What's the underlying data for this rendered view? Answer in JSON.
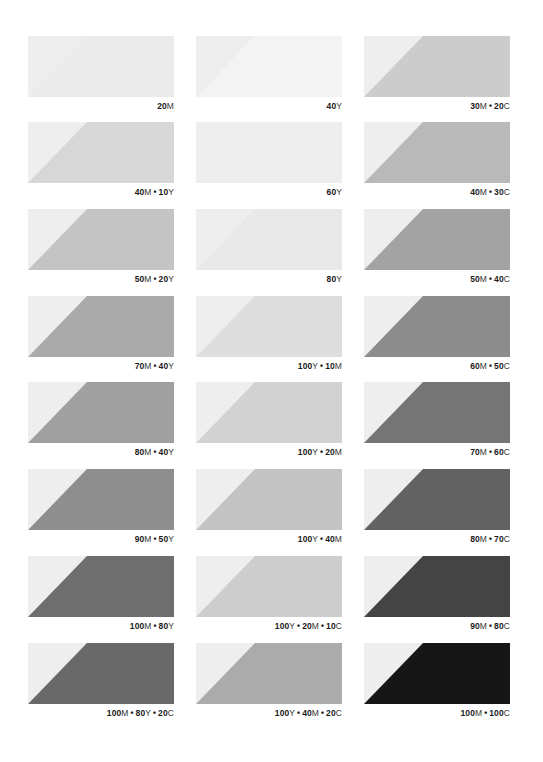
{
  "page": {
    "background": "#ffffff",
    "base_tint": "#eeeeee"
  },
  "chart_data": {
    "type": "table",
    "title": "",
    "layout": {
      "columns": 3,
      "rows": 8,
      "grid": false,
      "legend": "none"
    },
    "columns": [
      {
        "name": "left",
        "swatches": [
          {
            "label": "20M",
            "parts": [
              {
                "n": "20",
                "ink": "M"
              }
            ],
            "color": "#ebebeb"
          },
          {
            "label": "40M • 10Y",
            "parts": [
              {
                "n": "40",
                "ink": "M"
              },
              {
                "n": "10",
                "ink": "Y"
              }
            ],
            "color": "#d7d7d7"
          },
          {
            "label": "50M • 20Y",
            "parts": [
              {
                "n": "50",
                "ink": "M"
              },
              {
                "n": "20",
                "ink": "Y"
              }
            ],
            "color": "#c4c4c4"
          },
          {
            "label": "70M • 40Y",
            "parts": [
              {
                "n": "70",
                "ink": "M"
              },
              {
                "n": "40",
                "ink": "Y"
              }
            ],
            "color": "#aaaaaa"
          },
          {
            "label": "80M • 40Y",
            "parts": [
              {
                "n": "80",
                "ink": "M"
              },
              {
                "n": "40",
                "ink": "Y"
              }
            ],
            "color": "#a0a0a0"
          },
          {
            "label": "90M • 50Y",
            "parts": [
              {
                "n": "90",
                "ink": "M"
              },
              {
                "n": "50",
                "ink": "Y"
              }
            ],
            "color": "#8e8e8e"
          },
          {
            "label": "100M • 80Y",
            "parts": [
              {
                "n": "100",
                "ink": "M"
              },
              {
                "n": "80",
                "ink": "Y"
              }
            ],
            "color": "#6e6e6e"
          },
          {
            "label": "100M • 80Y • 20C",
            "parts": [
              {
                "n": "100",
                "ink": "M"
              },
              {
                "n": "80",
                "ink": "Y"
              },
              {
                "n": "20",
                "ink": "C"
              }
            ],
            "color": "#696969"
          }
        ]
      },
      {
        "name": "middle",
        "swatches": [
          {
            "label": "40Y",
            "parts": [
              {
                "n": "40",
                "ink": "Y"
              }
            ],
            "color": "#f3f3f3"
          },
          {
            "label": "60Y",
            "parts": [
              {
                "n": "60",
                "ink": "Y"
              }
            ],
            "color": "#eeeeee"
          },
          {
            "label": "80Y",
            "parts": [
              {
                "n": "80",
                "ink": "Y"
              }
            ],
            "color": "#e8e8e8"
          },
          {
            "label": "100Y • 10M",
            "parts": [
              {
                "n": "100",
                "ink": "Y"
              },
              {
                "n": "10",
                "ink": "M"
              }
            ],
            "color": "#dddddd"
          },
          {
            "label": "100Y • 20M",
            "parts": [
              {
                "n": "100",
                "ink": "Y"
              },
              {
                "n": "20",
                "ink": "M"
              }
            ],
            "color": "#d2d2d2"
          },
          {
            "label": "100Y • 40M",
            "parts": [
              {
                "n": "100",
                "ink": "Y"
              },
              {
                "n": "40",
                "ink": "M"
              }
            ],
            "color": "#c3c3c3"
          },
          {
            "label": "100Y • 20M • 10C",
            "parts": [
              {
                "n": "100",
                "ink": "Y"
              },
              {
                "n": "20",
                "ink": "M"
              },
              {
                "n": "10",
                "ink": "C"
              }
            ],
            "color": "#cdcdcd"
          },
          {
            "label": "100Y • 40M • 20C",
            "parts": [
              {
                "n": "100",
                "ink": "Y"
              },
              {
                "n": "40",
                "ink": "M"
              },
              {
                "n": "20",
                "ink": "C"
              }
            ],
            "color": "#ababab"
          }
        ]
      },
      {
        "name": "right",
        "swatches": [
          {
            "label": "30M • 20C",
            "parts": [
              {
                "n": "30",
                "ink": "M"
              },
              {
                "n": "20",
                "ink": "C"
              }
            ],
            "color": "#cccccc"
          },
          {
            "label": "40M • 30C",
            "parts": [
              {
                "n": "40",
                "ink": "M"
              },
              {
                "n": "30",
                "ink": "C"
              }
            ],
            "color": "#b9b9b9"
          },
          {
            "label": "50M • 40C",
            "parts": [
              {
                "n": "50",
                "ink": "M"
              },
              {
                "n": "40",
                "ink": "C"
              }
            ],
            "color": "#a3a3a3"
          },
          {
            "label": "60M • 50C",
            "parts": [
              {
                "n": "60",
                "ink": "M"
              },
              {
                "n": "50",
                "ink": "C"
              }
            ],
            "color": "#8c8c8c"
          },
          {
            "label": "70M • 60C",
            "parts": [
              {
                "n": "70",
                "ink": "M"
              },
              {
                "n": "60",
                "ink": "C"
              }
            ],
            "color": "#757575"
          },
          {
            "label": "80M • 70C",
            "parts": [
              {
                "n": "80",
                "ink": "M"
              },
              {
                "n": "70",
                "ink": "C"
              }
            ],
            "color": "#626262"
          },
          {
            "label": "90M • 80C",
            "parts": [
              {
                "n": "90",
                "ink": "M"
              },
              {
                "n": "80",
                "ink": "C"
              }
            ],
            "color": "#444444"
          },
          {
            "label": "100M • 100C",
            "parts": [
              {
                "n": "100",
                "ink": "M"
              },
              {
                "n": "100",
                "ink": "C"
              }
            ],
            "color": "#161616"
          }
        ]
      }
    ]
  }
}
